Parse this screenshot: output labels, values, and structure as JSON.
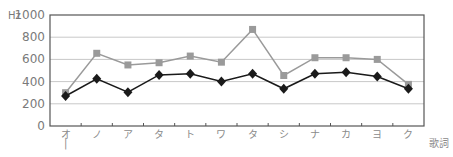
{
  "chart_data": {
    "type": "line",
    "title": "",
    "ylabel": "Hz",
    "xlabel": "歌詞",
    "ylim": [
      0,
      1000
    ],
    "yticks": [
      0,
      200,
      400,
      600,
      800,
      1000
    ],
    "grid": true,
    "legend": null,
    "categories": [
      "オー",
      "ノ",
      "ア",
      "タ",
      "ト",
      "ワ",
      "タ",
      "シ",
      "ナ",
      "カ",
      "ヨ",
      "ク"
    ],
    "series": [
      {
        "name": "gray-square-series",
        "color": "#9a9a9a",
        "marker": "square",
        "values": [
          300,
          655,
          550,
          570,
          630,
          575,
          870,
          455,
          615,
          615,
          600,
          375
        ]
      },
      {
        "name": "black-diamond-series",
        "color": "#1a1a1a",
        "marker": "diamond",
        "values": [
          270,
          425,
          305,
          460,
          470,
          400,
          470,
          335,
          470,
          485,
          445,
          335
        ]
      }
    ]
  },
  "axis": {
    "y_unit": "Hz",
    "x_title": "歌詞"
  },
  "colors": {
    "frame": "#555555",
    "grid": "#c8c8c8",
    "tick_text": "#7a7a7a"
  }
}
